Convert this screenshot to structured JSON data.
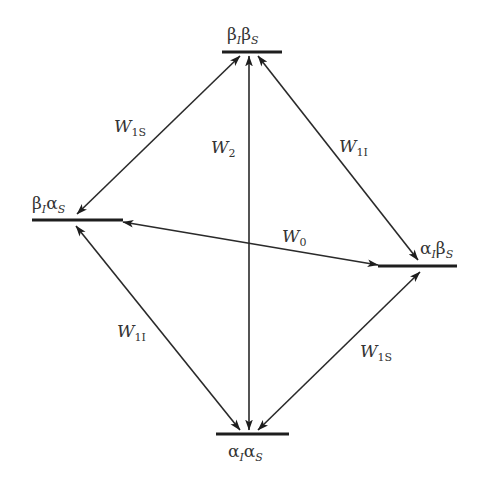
{
  "diagram": {
    "type": "energy-level transition diagram",
    "levels": [
      {
        "id": "top",
        "main1": "β",
        "sub1": "I",
        "main2": "β",
        "sub2": "S"
      },
      {
        "id": "left",
        "main1": "β",
        "sub1": "I",
        "main2": "α",
        "sub2": "S"
      },
      {
        "id": "right",
        "main1": "α",
        "sub1": "I",
        "main2": "β",
        "sub2": "S"
      },
      {
        "id": "bottom",
        "main1": "α",
        "sub1": "I",
        "main2": "α",
        "sub2": "S"
      }
    ],
    "transitions": [
      {
        "from": "top",
        "to": "left",
        "label": "W",
        "sub": "1S"
      },
      {
        "from": "top",
        "to": "bottom",
        "label": "W",
        "sub": "2"
      },
      {
        "from": "top",
        "to": "right",
        "label": "W",
        "sub": "1I"
      },
      {
        "from": "left",
        "to": "right",
        "label": "W",
        "sub": "0"
      },
      {
        "from": "left",
        "to": "bottom",
        "label": "W",
        "sub": "1I"
      },
      {
        "from": "right",
        "to": "bottom",
        "label": "W",
        "sub": "1S"
      }
    ]
  }
}
